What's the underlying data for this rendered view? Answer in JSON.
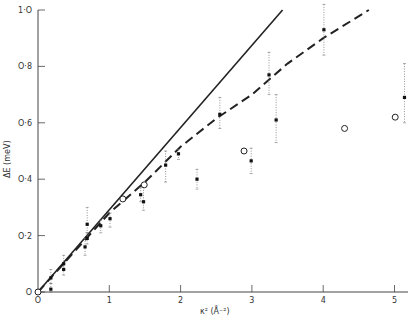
{
  "chart_data": {
    "type": "scatter",
    "title": "",
    "xlabel": "κ² (Å⁻²)",
    "ylabel": "ΔE (meV)",
    "xlim": [
      0,
      5.3
    ],
    "ylim": [
      0,
      1.0
    ],
    "grid": false,
    "legend": null,
    "xticks": [
      {
        "value": 0,
        "label": "O"
      },
      {
        "value": 1,
        "label": "1"
      },
      {
        "value": 2,
        "label": "2"
      },
      {
        "value": 3,
        "label": "3"
      },
      {
        "value": 4,
        "label": "4"
      },
      {
        "value": 5,
        "label": "5"
      }
    ],
    "yticks": [
      {
        "value": 0,
        "label": "O"
      },
      {
        "value": 0.2,
        "label": "O·2"
      },
      {
        "value": 0.4,
        "label": "O·4"
      },
      {
        "value": 0.6,
        "label": "O·6"
      },
      {
        "value": 0.8,
        "label": "O·8"
      },
      {
        "value": 1.0,
        "label": "1·O"
      }
    ],
    "series": [
      {
        "name": "measured (with error bars)",
        "marker": "filled",
        "points": [
          {
            "x": 0.18,
            "y": 0.05,
            "lo": 0.03,
            "hi": 0.08
          },
          {
            "x": 0.18,
            "y": 0.01,
            "lo": 0.0,
            "hi": 0.03
          },
          {
            "x": 0.36,
            "y": 0.1,
            "lo": 0.08,
            "hi": 0.13
          },
          {
            "x": 0.36,
            "y": 0.08,
            "lo": 0.06,
            "hi": 0.1
          },
          {
            "x": 0.66,
            "y": 0.16,
            "lo": 0.13,
            "hi": 0.19
          },
          {
            "x": 0.69,
            "y": 0.19,
            "lo": 0.17,
            "hi": 0.21
          },
          {
            "x": 0.69,
            "y": 0.24,
            "lo": 0.21,
            "hi": 0.3
          },
          {
            "x": 0.88,
            "y": 0.235,
            "lo": 0.21,
            "hi": 0.255
          },
          {
            "x": 1.01,
            "y": 0.26,
            "lo": 0.23,
            "hi": 0.28
          },
          {
            "x": 1.44,
            "y": 0.345,
            "lo": 0.32,
            "hi": 0.37
          },
          {
            "x": 1.48,
            "y": 0.32,
            "lo": 0.29,
            "hi": 0.38
          },
          {
            "x": 1.79,
            "y": 0.45,
            "lo": 0.39,
            "hi": 0.5
          },
          {
            "x": 1.97,
            "y": 0.49,
            "lo": 0.47,
            "hi": 0.505
          },
          {
            "x": 2.23,
            "y": 0.4,
            "lo": 0.365,
            "hi": 0.435
          },
          {
            "x": 2.55,
            "y": 0.63,
            "lo": 0.58,
            "hi": 0.69
          },
          {
            "x": 2.99,
            "y": 0.465,
            "lo": 0.42,
            "hi": 0.51
          },
          {
            "x": 3.24,
            "y": 0.77,
            "lo": 0.7,
            "hi": 0.85
          },
          {
            "x": 3.34,
            "y": 0.61,
            "lo": 0.53,
            "hi": 0.7
          },
          {
            "x": 4.01,
            "y": 0.93,
            "lo": 0.84,
            "hi": 1.02
          },
          {
            "x": 5.14,
            "y": 0.69,
            "lo": 0.6,
            "hi": 0.81
          }
        ]
      },
      {
        "name": "open circles",
        "marker": "open-circle",
        "points": [
          {
            "x": 0.0,
            "y": 0.0
          },
          {
            "x": 1.19,
            "y": 0.33
          },
          {
            "x": 1.49,
            "y": 0.38
          },
          {
            "x": 2.89,
            "y": 0.5
          },
          {
            "x": 4.3,
            "y": 0.58
          },
          {
            "x": 5.01,
            "y": 0.62
          }
        ]
      },
      {
        "name": "solid line (linear)",
        "style": "solid",
        "x": [
          0,
          3.43
        ],
        "y": [
          0,
          1.0
        ]
      },
      {
        "name": "dashed curve",
        "style": "dashed",
        "x": [
          0,
          0.5,
          1.0,
          1.5,
          2.0,
          2.5,
          3.0,
          3.5,
          4.0,
          4.64
        ],
        "y": [
          0,
          0.14,
          0.28,
          0.39,
          0.515,
          0.615,
          0.7,
          0.81,
          0.9,
          1.0
        ]
      }
    ]
  }
}
